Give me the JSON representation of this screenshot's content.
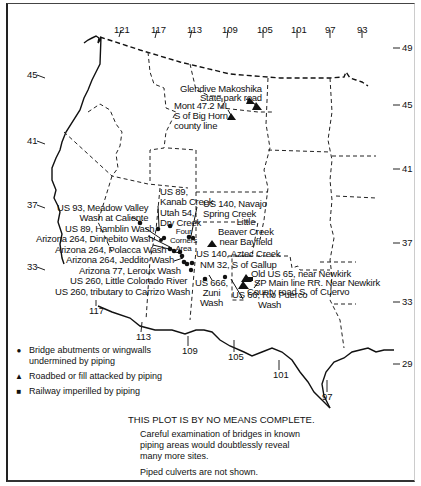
{
  "map": {
    "longitude_ticks_top": [
      "121",
      "117",
      "113",
      "109",
      "105",
      "101",
      "97",
      "93"
    ],
    "longitude_ticks_bottom": [
      "117",
      "113",
      "109",
      "105",
      "101",
      "97"
    ],
    "latitude_ticks_left": [
      "45",
      "41",
      "37",
      "33"
    ],
    "latitude_ticks_right": [
      "49",
      "45",
      "41",
      "37",
      "33",
      "29"
    ],
    "sites": {
      "glendive": "Glendive Makoshika\nState park road",
      "mont": "Mont 47.2 MI\nS of Big Horn\ncounty line",
      "us93": "US 93, Meadow Valley\nWash at Caliente",
      "us89_hamblin": "US 89, Hamblin Wash",
      "az264_dinnebito": "Arizona 264, Dinnebito Wash",
      "az264_polacca": "Arizona 264, Polacca Wash",
      "az264_jeddito": "Arizona 264, Jeddito Wash",
      "az77_leroux": "Arizona 77, Leroux Wash",
      "us260_little": "US 260, Little Colorado River",
      "us260_carrizo": "US 260, tributary to Carrizo Wash",
      "us89_kanab": "US 89,\nKanab Creek",
      "utah54": "Utah 54,\nDry Creek",
      "four_corners": "Four\nCorners\nArea",
      "us140_navajo": "US 140, Navajo\nSpring Creek",
      "little_beaver": "Little\nBeaver Creek\nnear Bayfield",
      "us140_aztec": "US 140, Aztec Creek",
      "nm32": "NM 32, S of Gallup",
      "us666": "US 666,\nZuni\nWash",
      "us66": "US 66, Rio Puerco\nWash",
      "old_us65": "Old US 65, near Newkirk",
      "sp_main": "SP Main line RR. Near Newkirk",
      "county_road": "County road S. of Cuervo"
    }
  },
  "legend": {
    "items": [
      {
        "symbol": "●",
        "label": "Bridge abutments or wingwalls undermined by piping"
      },
      {
        "symbol": "▲",
        "label": "Roadbed or fill attacked by piping"
      },
      {
        "symbol": "■",
        "label": "Railway imperilled by piping"
      }
    ]
  },
  "note": {
    "title": "THIS PLOT IS BY NO MEANS COMPLETE.",
    "line1": "Careful examination of bridges in known",
    "line2": "piping areas would doubtlessly reveal",
    "line3": "many more sites.",
    "line4": "Piped culverts are not shown."
  }
}
